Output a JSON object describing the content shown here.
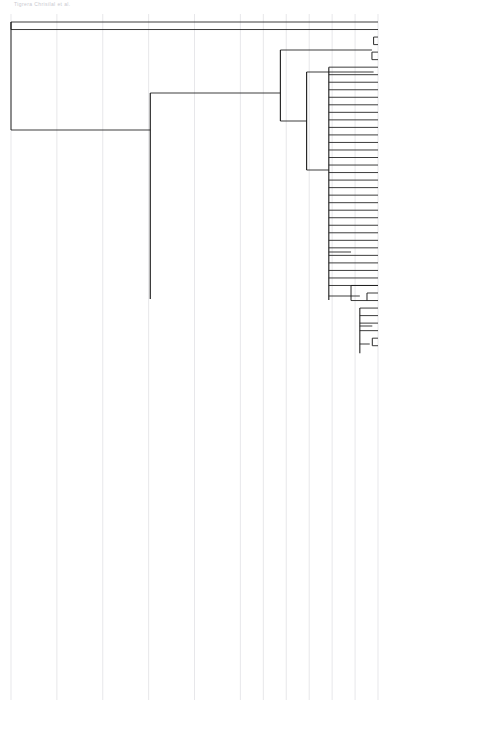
{
  "header_note": "Tigrera Chrisilal et al.",
  "axis": {
    "unit": "YA",
    "ticks": [
      {
        "label": "200000",
        "value": 200000
      },
      {
        "label": "150000",
        "value": 150000
      },
      {
        "label": "125000",
        "value": 125000
      },
      {
        "label": "100000",
        "value": 100000
      },
      {
        "label": "75000",
        "value": 75000
      },
      {
        "label": "50000",
        "value": 50000
      },
      {
        "label": "25000",
        "value": 25000
      },
      {
        "label": "0",
        "value": 0
      }
    ],
    "min": 0,
    "max": 200000
  },
  "clades": [
    {
      "name": "OUTGROUPS",
      "bar_color": "#111111",
      "orientation": "horizontal"
    },
    {
      "name": "Aegla cholchol",
      "bar_color": "#cfcfcf",
      "orientation": "vertical"
    },
    {
      "name": "Aegla rostrata",
      "bar_color": "#111111",
      "orientation": "vertical"
    }
  ],
  "nodes": [
    {
      "age": "124100",
      "support": "100",
      "x": 124100,
      "y": 130,
      "hpd_lo": 178000,
      "hpd_hi": 73000
    },
    {
      "age": "78000",
      "support": "100",
      "x": 78000,
      "y": 299,
      "hpd_lo": 105000,
      "hpd_hi": 44000
    },
    {
      "age": "53200",
      "support": "83",
      "x": 53200,
      "y": 93,
      "hpd_lo": 73000,
      "hpd_hi": 33000
    },
    {
      "age": "38900",
      "support": "90",
      "x": 38900,
      "y": 121,
      "hpd_lo": 49000,
      "hpd_hi": 25000
    },
    {
      "age": "26800",
      "support": "100",
      "x": 26800,
      "y": 170,
      "hpd_lo": 33000,
      "hpd_hi": 18000
    },
    {
      "age": "22500",
      "support": "100",
      "x": 22500,
      "y": 497,
      "hpd_lo": 29000,
      "hpd_hi": 16000
    },
    {
      "age": "14700",
      "support": "",
      "x": 14700,
      "y": 252,
      "hpd_lo": 19000,
      "hpd_hi": 10000
    },
    {
      "age": "9900",
      "support": "",
      "x": 9900,
      "y": 296,
      "hpd_lo": 13500,
      "hpd_hi": 6500
    },
    {
      "age": "3100",
      "support": "",
      "x": 3100,
      "y": 326,
      "hpd_lo": 5200,
      "hpd_hi": 1500
    },
    {
      "age": "4500",
      "support": "",
      "x": 4500,
      "y": 344,
      "hpd_lo": 7000,
      "hpd_hi": 2300
    },
    {
      "age": "3300",
      "support": "",
      "x": 3300,
      "y": 72,
      "hpd_lo": 5600,
      "hpd_hi": 1400
    },
    {
      "age": "2400",
      "support": "",
      "x": 2400,
      "y": 50,
      "hpd_lo": 4300,
      "hpd_hi": 900
    },
    {
      "age": "5000",
      "support": "",
      "x": 5000,
      "y": 639,
      "hpd_lo": 8300,
      "hpd_hi": 2400
    },
    {
      "age": "10300",
      "support": "",
      "x": 10300,
      "y": 669,
      "hpd_lo": 15000,
      "hpd_hi": 6000
    },
    {
      "age": "5300",
      "support": "",
      "x": 5300,
      "y": 684,
      "hpd_lo": 8700,
      "hpd_hi": 2500
    }
  ],
  "tips": [
    {
      "label": "Aegla abtao",
      "group": "outgroup"
    },
    {
      "label": "Aegla alacalufi",
      "group": "outgroup"
    },
    {
      "label": "KAC-A71",
      "group": "cholchol"
    },
    {
      "label": "KACa2023",
      "group": "cholchol"
    },
    {
      "label": "KACa2028",
      "group": "cholchol"
    },
    {
      "label": "KAC-A68",
      "group": "cholchol"
    },
    {
      "label": "KACa2006",
      "group": "cholchol"
    },
    {
      "label": "KACa2024",
      "group": "cholchol"
    },
    {
      "label": "KACa1994",
      "group": "cholchol"
    },
    {
      "label": "KACa1997",
      "group": "cholchol"
    },
    {
      "label": "KACa1998",
      "group": "cholchol"
    },
    {
      "label": "KACa1999",
      "group": "cholchol"
    },
    {
      "label": "KACa2000",
      "group": "cholchol"
    },
    {
      "label": "KACa2003",
      "group": "cholchol"
    },
    {
      "label": "KACa2004",
      "group": "cholchol"
    },
    {
      "label": "KACa2007",
      "group": "cholchol"
    },
    {
      "label": "KACa2008",
      "group": "cholchol"
    },
    {
      "label": "KACa2009",
      "group": "cholchol"
    },
    {
      "label": "KACa2010",
      "group": "cholchol"
    },
    {
      "label": "KACa2012",
      "group": "cholchol"
    },
    {
      "label": "KACa2014",
      "group": "cholchol"
    },
    {
      "label": "KACa2017",
      "group": "cholchol"
    },
    {
      "label": "KACa2018",
      "group": "cholchol"
    },
    {
      "label": "KACa2020",
      "group": "cholchol"
    },
    {
      "label": "KACa2021",
      "group": "cholchol"
    },
    {
      "label": "KACa2022",
      "group": "cholchol"
    },
    {
      "label": "KACa2025",
      "group": "cholchol"
    },
    {
      "label": "KACa2027",
      "group": "cholchol"
    },
    {
      "label": "KACa2030",
      "group": "cholchol"
    },
    {
      "label": "KACa2032",
      "group": "cholchol"
    },
    {
      "label": "KACa2005",
      "group": "cholchol"
    },
    {
      "label": "KACa2026",
      "group": "cholchol"
    },
    {
      "label": "KACa2029",
      "group": "cholchol"
    },
    {
      "label": "KACa2002",
      "group": "cholchol"
    },
    {
      "label": "KACa2031",
      "group": "cholchol"
    },
    {
      "label": "KACa2001",
      "group": "cholchol"
    },
    {
      "label": "KACa2011",
      "group": "cholchol"
    },
    {
      "label": "KACa2015",
      "group": "cholchol"
    },
    {
      "label": "KACa2016",
      "group": "cholchol"
    },
    {
      "label": "KACa2013",
      "group": "cholchol"
    },
    {
      "label": "KAC-A69",
      "group": "cholchol"
    },
    {
      "label": "KAC-A71b",
      "group": "cholchol"
    },
    {
      "label": "KACa1992",
      "group": "cholchol"
    },
    {
      "label": "KACa2012b",
      "group": "cholchol"
    },
    {
      "label": "KACa2019",
      "group": "cholchol"
    },
    {
      "label": "KACa1952",
      "group": "rostrata"
    },
    {
      "label": "KACa1954",
      "group": "rostrata"
    },
    {
      "label": "KACa1955",
      "group": "rostrata"
    },
    {
      "label": "KACa1956",
      "group": "rostrata"
    },
    {
      "label": "KACa1957",
      "group": "rostrata"
    },
    {
      "label": "KACa1958",
      "group": "rostrata"
    },
    {
      "label": "KACa1959",
      "group": "rostrata"
    },
    {
      "label": "KACa1960",
      "group": "rostrata"
    },
    {
      "label": "KACa1961",
      "group": "rostrata"
    },
    {
      "label": "KACa1962",
      "group": "rostrata"
    },
    {
      "label": "KACa1964",
      "group": "rostrata"
    },
    {
      "label": "KACa1965",
      "group": "rostrata"
    },
    {
      "label": "KACa1967",
      "group": "rostrata"
    },
    {
      "label": "KACa1968",
      "group": "rostrata"
    },
    {
      "label": "KACa1969",
      "group": "rostrata"
    },
    {
      "label": "KACa1970",
      "group": "rostrata"
    },
    {
      "label": "KACa1972",
      "group": "rostrata"
    },
    {
      "label": "KACa1973",
      "group": "rostrata"
    },
    {
      "label": "KACa1975",
      "group": "rostrata"
    },
    {
      "label": "KACa1976",
      "group": "rostrata"
    },
    {
      "label": "KACa1977",
      "group": "rostrata"
    },
    {
      "label": "KACa1978",
      "group": "rostrata"
    },
    {
      "label": "KACa1979",
      "group": "rostrata"
    },
    {
      "label": "KACa1980",
      "group": "rostrata"
    },
    {
      "label": "KACa1982",
      "group": "rostrata"
    },
    {
      "label": "KACa1983",
      "group": "rostrata"
    },
    {
      "label": "KACa1984",
      "group": "rostrata"
    },
    {
      "label": "KACa1985",
      "group": "rostrata"
    },
    {
      "label": "KACa1986",
      "group": "rostrata"
    },
    {
      "label": "KACa1987",
      "group": "rostrata"
    },
    {
      "label": "KACa1988",
      "group": "rostrata"
    },
    {
      "label": "KACa1990",
      "group": "rostrata"
    },
    {
      "label": "KACa1991",
      "group": "rostrata"
    },
    {
      "label": "KAC-AR1",
      "group": "rostrata"
    },
    {
      "label": "KAC-AR4",
      "group": "rostrata"
    },
    {
      "label": "KACa1963",
      "group": "rostrata"
    },
    {
      "label": "KACa1981",
      "group": "rostrata"
    },
    {
      "label": "KACa1966",
      "group": "rostrata"
    },
    {
      "label": "KACa1974",
      "group": "rostrata"
    },
    {
      "label": "KACa1971",
      "group": "rostrata"
    },
    {
      "label": "KACa1989",
      "group": "rostrata"
    },
    {
      "label": "KACa1953",
      "group": "rostrata"
    },
    {
      "label": "KACa1993",
      "group": "rostrata"
    },
    {
      "label": "KACa1995",
      "group": "rostrata"
    },
    {
      "label": "KACa1996",
      "group": "rostrata"
    }
  ],
  "colors": {
    "branch": "#1a1a1a",
    "hpd_bar": "#b6b6bb",
    "gridline": "#d6d6dc",
    "support_box": "#141414",
    "support_text": "#ffffff",
    "axis": "#111111"
  }
}
